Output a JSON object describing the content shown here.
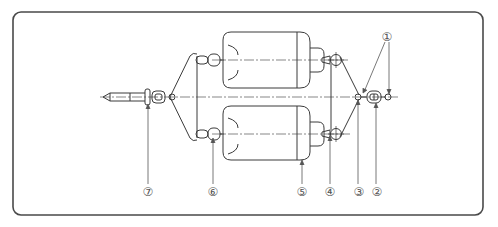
{
  "diagram": {
    "stroke_color": "#3a3a3a",
    "frame_color": "#4a4a4a",
    "labels": [
      {
        "id": "1",
        "text": "①",
        "x": 387,
        "y": 37,
        "target": "ring/pin connectors"
      },
      {
        "id": "2",
        "text": "②",
        "x": 377,
        "y": 192,
        "target": "shackle"
      },
      {
        "id": "3",
        "text": "③",
        "x": 359,
        "y": 192,
        "target": "sling junction ring"
      },
      {
        "id": "4",
        "text": "④",
        "x": 330,
        "y": 192,
        "target": "end pulley/eye"
      },
      {
        "id": "5",
        "text": "⑤",
        "x": 302,
        "y": 192,
        "target": "cylinder"
      },
      {
        "id": "6",
        "text": "⑥",
        "x": 213,
        "y": 192,
        "target": "trunnion pin"
      },
      {
        "id": "7",
        "text": "⑦",
        "x": 148,
        "y": 192,
        "target": "turnbuckle/hook"
      }
    ]
  }
}
